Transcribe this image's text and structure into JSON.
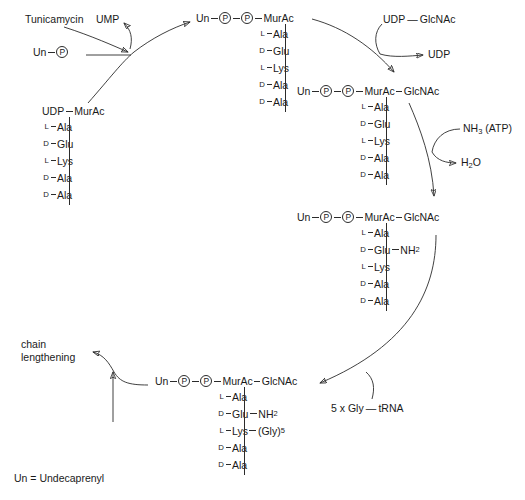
{
  "diagram": {
    "legend": "Un = Undecaprenyl",
    "line_color": "#2b2b2b",
    "background": "#ffffff"
  },
  "labels": {
    "tunicamycin": "Tunicamycin",
    "ump": "UMP",
    "udp_glcnac": "UDP — GlcNAc",
    "udp": "UDP",
    "nh3_atp_prefix": "NH",
    "nh3_atp_sub": "3",
    "nh3_atp_suffix": " (ATP)",
    "water_prefix": "H",
    "water_sub": "2",
    "water_suffix": "O",
    "gly_trna": "5 x Gly — tRNA",
    "chain_lengthening": "chain\nlengthening"
  },
  "units": {
    "un": "Un",
    "p": "P",
    "murac": "MurAc",
    "glcnac": "GlcNAc",
    "udp": "UDP"
  },
  "structures": {
    "udp_murac": {
      "name": "UDP-MurAc pentapeptide",
      "head": [
        "UDP",
        "MurAc"
      ],
      "peptide": [
        {
          "chirality": "L",
          "residue": "Ala"
        },
        {
          "chirality": "D",
          "residue": "Glu"
        },
        {
          "chirality": "L",
          "residue": "Lys"
        },
        {
          "chirality": "D",
          "residue": "Ala"
        },
        {
          "chirality": "D",
          "residue": "Ala"
        }
      ]
    },
    "lipid1": {
      "name": "Un-P-P-MurAc pentapeptide (Lipid I)",
      "head": [
        "Un",
        "P",
        "P",
        "MurAc"
      ],
      "peptide": [
        {
          "chirality": "L",
          "residue": "Ala"
        },
        {
          "chirality": "D",
          "residue": "Glu"
        },
        {
          "chirality": "L",
          "residue": "Lys"
        },
        {
          "chirality": "D",
          "residue": "Ala"
        },
        {
          "chirality": "D",
          "residue": "Ala"
        }
      ]
    },
    "lipid2": {
      "name": "Un-P-P-MurAc-GlcNAc pentapeptide (Lipid II)",
      "head": [
        "Un",
        "P",
        "P",
        "MurAc",
        "GlcNAc"
      ],
      "peptide": [
        {
          "chirality": "L",
          "residue": "Ala"
        },
        {
          "chirality": "D",
          "residue": "Glu"
        },
        {
          "chirality": "L",
          "residue": "Lys"
        },
        {
          "chirality": "D",
          "residue": "Ala"
        },
        {
          "chirality": "D",
          "residue": "Ala"
        }
      ]
    },
    "lipid2_amidated": {
      "name": "Un-P-P-MurAc-GlcNAc with amidated Glu",
      "head": [
        "Un",
        "P",
        "P",
        "MurAc",
        "GlcNAc"
      ],
      "peptide": [
        {
          "chirality": "L",
          "residue": "Ala"
        },
        {
          "chirality": "D",
          "residue": "Glu",
          "branch": "NH",
          "branch_sub": "2"
        },
        {
          "chirality": "L",
          "residue": "Lys"
        },
        {
          "chirality": "D",
          "residue": "Ala"
        },
        {
          "chirality": "D",
          "residue": "Ala"
        }
      ]
    },
    "lipid2_gly5": {
      "name": "Un-P-P-MurAc-GlcNAc with pentaglycine bridge",
      "head": [
        "Un",
        "P",
        "P",
        "MurAc",
        "GlcNAc"
      ],
      "peptide": [
        {
          "chirality": "L",
          "residue": "Ala"
        },
        {
          "chirality": "D",
          "residue": "Glu",
          "branch": "NH",
          "branch_sub": "2"
        },
        {
          "chirality": "L",
          "residue": "Lys",
          "branch": "(Gly)",
          "branch_sub": "5"
        },
        {
          "chirality": "D",
          "residue": "Ala"
        },
        {
          "chirality": "D",
          "residue": "Ala"
        }
      ]
    },
    "un_p": {
      "name": "Undecaprenyl phosphate",
      "head": [
        "Un",
        "P"
      ]
    }
  }
}
